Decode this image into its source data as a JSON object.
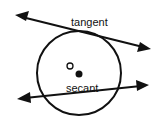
{
  "diagram": {
    "labels": {
      "tangent": "tangent",
      "secant": "secant",
      "center": "O"
    },
    "colors": {
      "stroke": "#111111",
      "background": "#ffffff"
    }
  }
}
